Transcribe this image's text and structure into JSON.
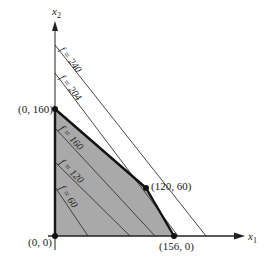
{
  "diagram": {
    "type": "linear-programming-feasible-region",
    "axes": {
      "x_label": "x",
      "x_sub": "1",
      "y_label": "x",
      "y_sub": "2"
    },
    "vertices": [
      {
        "label": "(0, 0)",
        "x": 0,
        "y": 0
      },
      {
        "label": "(0, 160)",
        "x": 0,
        "y": 160
      },
      {
        "label": "(120, 60)",
        "x": 120,
        "y": 60
      },
      {
        "label": "(156, 0)",
        "x": 156,
        "y": 0
      }
    ],
    "objective_lines": [
      {
        "label": "f = 240",
        "value": 240
      },
      {
        "label": "f = 204",
        "value": 204
      },
      {
        "label": "f = 160",
        "value": 160
      },
      {
        "label": "f = 120",
        "value": 120
      },
      {
        "label": "f = 60",
        "value": 60
      }
    ],
    "colors": {
      "region_fill": "#a9a9a9",
      "line": "#333333",
      "boundary": "#111111",
      "background": "#ffffff"
    }
  }
}
